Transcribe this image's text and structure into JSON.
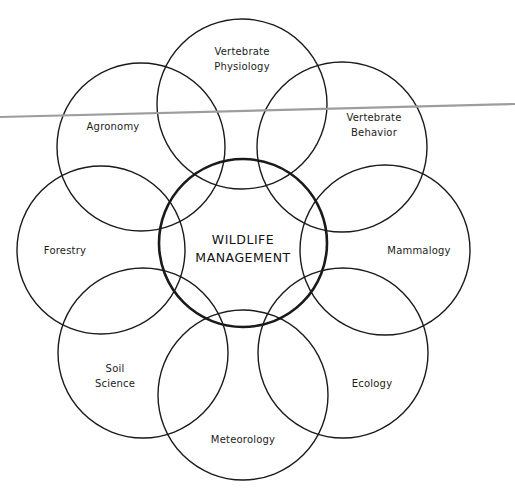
{
  "diagram": {
    "type": "venn-petal",
    "center": {
      "id": "wildlife-management",
      "lines": [
        "WILDLIFE",
        "MANAGEMENT"
      ],
      "cx": 243,
      "cy": 243,
      "r": 84,
      "label_x": 243,
      "label_y": 249
    },
    "disciplines": [
      {
        "id": "vertebrate-physiology",
        "lines": [
          "Vertebrate",
          "Physiology"
        ],
        "cx": 242,
        "cy": 104,
        "r": 85,
        "label_x": 242,
        "label_y": 59
      },
      {
        "id": "vertebrate-behavior",
        "lines": [
          "Vertebrate",
          "Behavior"
        ],
        "cx": 342,
        "cy": 147,
        "r": 85,
        "label_x": 374,
        "label_y": 125
      },
      {
        "id": "mammalogy",
        "lines": [
          "Mammalogy"
        ],
        "cx": 385,
        "cy": 250,
        "r": 85,
        "label_x": 419,
        "label_y": 250
      },
      {
        "id": "ecology",
        "lines": [
          "Ecology"
        ],
        "cx": 343,
        "cy": 353,
        "r": 85,
        "label_x": 372,
        "label_y": 383
      },
      {
        "id": "meteorology",
        "lines": [
          "Meteorology"
        ],
        "cx": 243,
        "cy": 395,
        "r": 85,
        "label_x": 243,
        "label_y": 439
      },
      {
        "id": "soil-science",
        "lines": [
          "Soil",
          "Science"
        ],
        "cx": 143,
        "cy": 353,
        "r": 85,
        "label_x": 115,
        "label_y": 376
      },
      {
        "id": "forestry",
        "lines": [
          "Forestry"
        ],
        "cx": 101,
        "cy": 250,
        "r": 84,
        "label_x": 65,
        "label_y": 250
      },
      {
        "id": "agronomy",
        "lines": [
          "Agronomy"
        ],
        "cx": 141,
        "cy": 147,
        "r": 84,
        "label_x": 113,
        "label_y": 126
      }
    ],
    "overlay_line": {
      "x1": 0,
      "y1": 117,
      "x2": 515,
      "y2": 104,
      "color": "#9d9d9d"
    }
  }
}
